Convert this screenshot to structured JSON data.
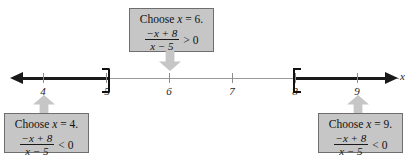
{
  "figure": {
    "kind": "number-line-sign-chart",
    "axis_variable": "x",
    "axis": {
      "ticks": [
        4,
        5,
        6,
        7,
        8,
        9
      ],
      "tick_labels": [
        "4",
        "5",
        "6",
        "7",
        "8",
        "9"
      ],
      "endpoints": [
        {
          "value": 5,
          "symbol": ")",
          "type": "open"
        },
        {
          "value": 8,
          "symbol": "[",
          "type": "closed"
        }
      ],
      "shaded_rays": [
        {
          "from": "-infinity",
          "to": 5,
          "direction": "left"
        },
        {
          "from": 8,
          "to": "+infinity",
          "direction": "right"
        }
      ]
    },
    "callouts": [
      {
        "id": "test-point-6",
        "position": "top",
        "target_value": 6,
        "heading_prefix": "Choose ",
        "heading_var": "x",
        "heading_suffix": " = 6.",
        "numerator": "−x + 8",
        "denominator": "x − 5",
        "comparator": "> 0"
      },
      {
        "id": "test-point-4",
        "position": "bottom-left",
        "target_value": 4,
        "heading_prefix": "Choose ",
        "heading_var": "x",
        "heading_suffix": " = 4.",
        "numerator": "−x + 8",
        "denominator": "x − 5",
        "comparator": "< 0"
      },
      {
        "id": "test-point-9",
        "position": "bottom-right",
        "target_value": 9,
        "heading_prefix": "Choose ",
        "heading_var": "x",
        "heading_suffix": " = 9.",
        "numerator": "−x + 8",
        "denominator": "x − 5",
        "comparator": "< 0"
      }
    ],
    "colors": {
      "callout_fill": "#c6c6c6",
      "callout_border": "#6e6e6e",
      "axis_light": "#9a9a9a",
      "axis_bold": "#1a1a1a",
      "text": "#111111"
    }
  }
}
